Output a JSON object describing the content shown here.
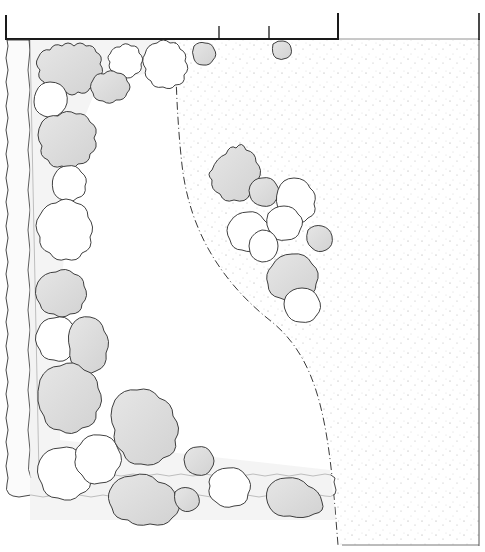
{
  "diagram": {
    "type": "landscape garden plan sketch",
    "colors": {
      "paper": "#ffffff",
      "ink": "#222222",
      "shade": "#d9d9d9",
      "shade_light": "#ececec",
      "stipple": "#9a9a9a"
    },
    "boundary_top": {
      "y": 39,
      "x_start": 6,
      "x_end": 338,
      "ticks": [
        {
          "x": 6,
          "y1": 15,
          "y2": 39
        },
        {
          "x": 219,
          "y1": 26,
          "y2": 39
        },
        {
          "x": 269,
          "y1": 26,
          "y2": 39
        },
        {
          "x": 338,
          "y1": 13,
          "y2": 39
        },
        {
          "x": 479,
          "y1": 13,
          "y2": 39
        }
      ]
    },
    "gravel_area": {
      "description": "stippled gravel/paved area right of curved edge"
    },
    "lawn_area": {
      "description": "open lawn bounded by dash-dot curve"
    },
    "shrub_groups": [
      {
        "name": "top-border-shrubs",
        "count": 7
      },
      {
        "name": "left-border-shrubs",
        "count": 8
      },
      {
        "name": "bottom-border-shrubs",
        "count": 8
      },
      {
        "name": "island-bed-shrubs",
        "count": 9
      }
    ]
  }
}
